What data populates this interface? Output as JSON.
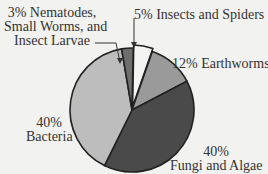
{
  "chart_data": {
    "type": "pie",
    "title": "",
    "slices": [
      {
        "label": "Insects and Spiders",
        "value": 5,
        "color": "#f4f4f2"
      },
      {
        "label": "Earthworms",
        "value": 12,
        "color": "#9a9a9a"
      },
      {
        "label": "Fungi and Algae",
        "value": 40,
        "color": "#4a4a4a"
      },
      {
        "label": "Bacteria",
        "value": 40,
        "color": "#bdbdbd"
      },
      {
        "label": "Nematodes, Small Worms, and Insect Larvae",
        "value": 3,
        "color": "#6e6e6e"
      }
    ]
  },
  "labels": {
    "nematodes": [
      "3% Nematodes,",
      "Small Worms, and",
      "Insect Larvae"
    ],
    "insects": "5% Insects and Spiders",
    "earthworms": "12% Earthworms",
    "bacteria": [
      "40%",
      "Bacteria"
    ],
    "fungi": [
      "40%",
      "Fungi and Algae"
    ]
  }
}
